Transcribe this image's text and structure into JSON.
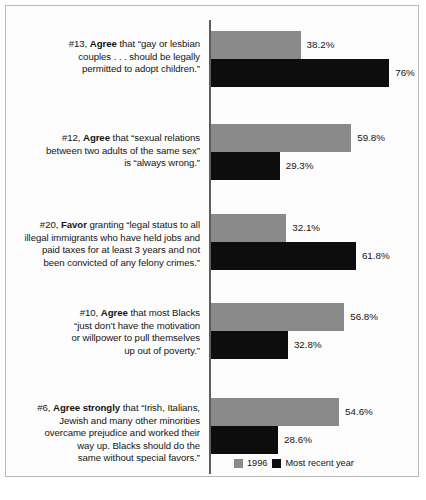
{
  "chart_data": {
    "type": "bar",
    "orientation": "horizontal",
    "title": "",
    "xlabel": "",
    "ylabel": "",
    "xlim": [
      0,
      80
    ],
    "grid": false,
    "legend_position": "bottom-right",
    "value_suffix": "%",
    "series": [
      {
        "name": "1996",
        "color": "#8a8a8a",
        "values": [
          38.2,
          59.8,
          32.1,
          56.8,
          54.6
        ]
      },
      {
        "name": "Most recent year",
        "color": "#0d0d0d",
        "values": [
          76,
          29.3,
          61.8,
          32.8,
          28.6
        ]
      }
    ],
    "categories": [
      "#13, Agree that “gay or lesbian couples . . . should be legally permitted to adopt children.”",
      "#12, Agree that “sexual relations between two adults of the same sex” is “always wrong.”",
      "#20, Favor granting “legal status to all illegal immigrants who have held jobs and paid taxes for at least 3 years and not been convicted of any felony crimes.”",
      "#10, Agree that most Blacks “just don’t have the motivation or willpower to pull themselves up out of poverty.”",
      "#6, Agree strongly that “Irish, Italians, Jewish and many other minorities overcame prejudice and worked their way up. Blacks should do the same without special favors.”"
    ],
    "value_labels": {
      "series_1996": [
        "38.2%",
        "59.8%",
        "32.1%",
        "56.8%",
        "54.6%"
      ],
      "series_recent": [
        "76%",
        "29.3%",
        "61.8%",
        "32.8%",
        "28.6%"
      ]
    }
  },
  "groups": [
    {
      "id": "group-13",
      "label_lines": [
        {
          "prefix": "#13, ",
          "bold": "Agree",
          "rest": " that “gay or lesbian"
        },
        {
          "prefix": "",
          "bold": "",
          "rest": "couples . . . should be legally"
        },
        {
          "prefix": "",
          "bold": "",
          "rest": "permitted to adopt children.”"
        }
      ],
      "gray_value": "38.2%",
      "black_value": "76%"
    },
    {
      "id": "group-12",
      "label_lines": [
        {
          "prefix": "#12, ",
          "bold": "Agree",
          "rest": " that “sexual relations"
        },
        {
          "prefix": "",
          "bold": "",
          "rest": "between two adults of the same sex”"
        },
        {
          "prefix": "",
          "bold": "",
          "rest": "is “always wrong.”"
        }
      ],
      "gray_value": "59.8%",
      "black_value": "29.3%"
    },
    {
      "id": "group-20",
      "label_lines": [
        {
          "prefix": "#20, ",
          "bold": "Favor",
          "rest": " granting “legal status to all"
        },
        {
          "prefix": "",
          "bold": "",
          "rest": "illegal immigrants who have held jobs and"
        },
        {
          "prefix": "",
          "bold": "",
          "rest": "paid taxes for at least 3 years and not"
        },
        {
          "prefix": "",
          "bold": "",
          "rest": "been convicted of any felony crimes.”"
        }
      ],
      "gray_value": "32.1%",
      "black_value": "61.8%"
    },
    {
      "id": "group-10",
      "label_lines": [
        {
          "prefix": "#10, ",
          "bold": "Agree",
          "rest": " that most Blacks"
        },
        {
          "prefix": "",
          "bold": "",
          "rest": "“just don’t have the motivation"
        },
        {
          "prefix": "",
          "bold": "",
          "rest": "or willpower to pull themselves"
        },
        {
          "prefix": "",
          "bold": "",
          "rest": "up out of poverty.”"
        }
      ],
      "gray_value": "56.8%",
      "black_value": "32.8%"
    },
    {
      "id": "group-6",
      "label_lines": [
        {
          "prefix": "#6, ",
          "bold": "Agree strongly",
          "rest": " that “Irish, Italians,"
        },
        {
          "prefix": "",
          "bold": "",
          "rest": "Jewish and many other minorities"
        },
        {
          "prefix": "",
          "bold": "",
          "rest": "overcame prejudice and worked their"
        },
        {
          "prefix": "",
          "bold": "",
          "rest": "way up. Blacks should do the"
        },
        {
          "prefix": "",
          "bold": "",
          "rest": "same without special favors.”"
        }
      ],
      "gray_value": "54.6%",
      "black_value": "28.6%"
    }
  ],
  "legend": {
    "items": [
      {
        "label": "1996",
        "color": "#8a8a8a"
      },
      {
        "label": "Most recent year",
        "color": "#0d0d0d"
      }
    ]
  }
}
